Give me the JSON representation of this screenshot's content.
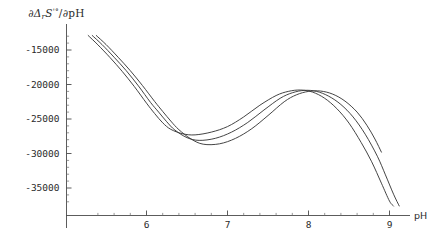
{
  "chart_data": {
    "type": "line",
    "title": "",
    "subtitle": "",
    "ylabel": "∂ΔᵣS'°/∂pH",
    "ylabel_parts": {
      "partial": "∂",
      "delta": "Δ",
      "delta_sub": "r",
      "quantity": "S",
      "prime_deg": "'°",
      "slash": "/",
      "partial2": "∂",
      "variable": "pH"
    },
    "xlabel": "pH",
    "xlim": [
      5.25,
      9.15
    ],
    "ylim": [
      -37800,
      -12200
    ],
    "xticks": [
      6,
      7,
      8,
      9
    ],
    "xtick_labels": [
      "6",
      "7",
      "8",
      "9"
    ],
    "ytick_values": [
      -15000,
      -20000,
      -25000,
      -30000,
      -35000
    ],
    "ytick_labels": [
      "-15000",
      "-20000",
      "-25000",
      "-30000",
      "-35000"
    ],
    "x_minor_ticks_per_interval": 5,
    "y_minor_ticks_per_interval": 5,
    "grid": false,
    "legend": null,
    "axis_style": "mathematica-cross-axes",
    "axis_color": "#4a4a4a",
    "curve_color": "#3a3a3a",
    "background_color": "#ffffff",
    "series": [
      {
        "name": "curve-1",
        "comment": "shallowest minimum, leftmost descent at high pH",
        "x": [
          5.28,
          5.4,
          5.55,
          5.7,
          5.85,
          6.0,
          6.1,
          6.2,
          6.3,
          6.45,
          6.6,
          6.8,
          7.0,
          7.2,
          7.4,
          7.6,
          7.75,
          7.9,
          8.05,
          8.2,
          8.35,
          8.5,
          8.65,
          8.78,
          8.9,
          9.0,
          9.05
        ],
        "y": [
          -12900,
          -14250,
          -16100,
          -18100,
          -20300,
          -22700,
          -24200,
          -25550,
          -26500,
          -27150,
          -27300,
          -26900,
          -26100,
          -24700,
          -23000,
          -21600,
          -21000,
          -20800,
          -21100,
          -22000,
          -23500,
          -25600,
          -28400,
          -31200,
          -34300,
          -36900,
          -37600
        ]
      },
      {
        "name": "curve-2",
        "comment": "intermediate minimum depth",
        "x": [
          5.33,
          5.45,
          5.6,
          5.75,
          5.9,
          6.05,
          6.15,
          6.25,
          6.35,
          6.5,
          6.65,
          6.85,
          7.05,
          7.25,
          7.45,
          7.65,
          7.8,
          7.95,
          8.1,
          8.25,
          8.4,
          8.55,
          8.7,
          8.85,
          8.95,
          9.05,
          9.12
        ],
        "y": [
          -12900,
          -14200,
          -16050,
          -18000,
          -20200,
          -22600,
          -24000,
          -25400,
          -26600,
          -27700,
          -28100,
          -27800,
          -26900,
          -25500,
          -23700,
          -22000,
          -21200,
          -20850,
          -21000,
          -21700,
          -22900,
          -24700,
          -27200,
          -30400,
          -33100,
          -35900,
          -37600
        ]
      },
      {
        "name": "curve-3",
        "comment": "deepest minimum, rightmost/highest endpoint",
        "x": [
          5.38,
          5.5,
          5.65,
          5.8,
          5.95,
          6.1,
          6.2,
          6.3,
          6.4,
          6.55,
          6.7,
          6.9,
          7.1,
          7.3,
          7.5,
          7.7,
          7.85,
          8.0,
          8.15,
          8.3,
          8.45,
          8.6,
          8.72,
          8.82,
          8.9
        ],
        "y": [
          -12900,
          -14200,
          -16050,
          -18000,
          -20150,
          -22450,
          -23900,
          -25300,
          -26550,
          -27900,
          -28650,
          -28600,
          -27800,
          -26400,
          -24500,
          -22500,
          -21500,
          -21000,
          -20950,
          -21400,
          -22400,
          -24000,
          -25900,
          -27900,
          -29800
        ]
      }
    ]
  }
}
